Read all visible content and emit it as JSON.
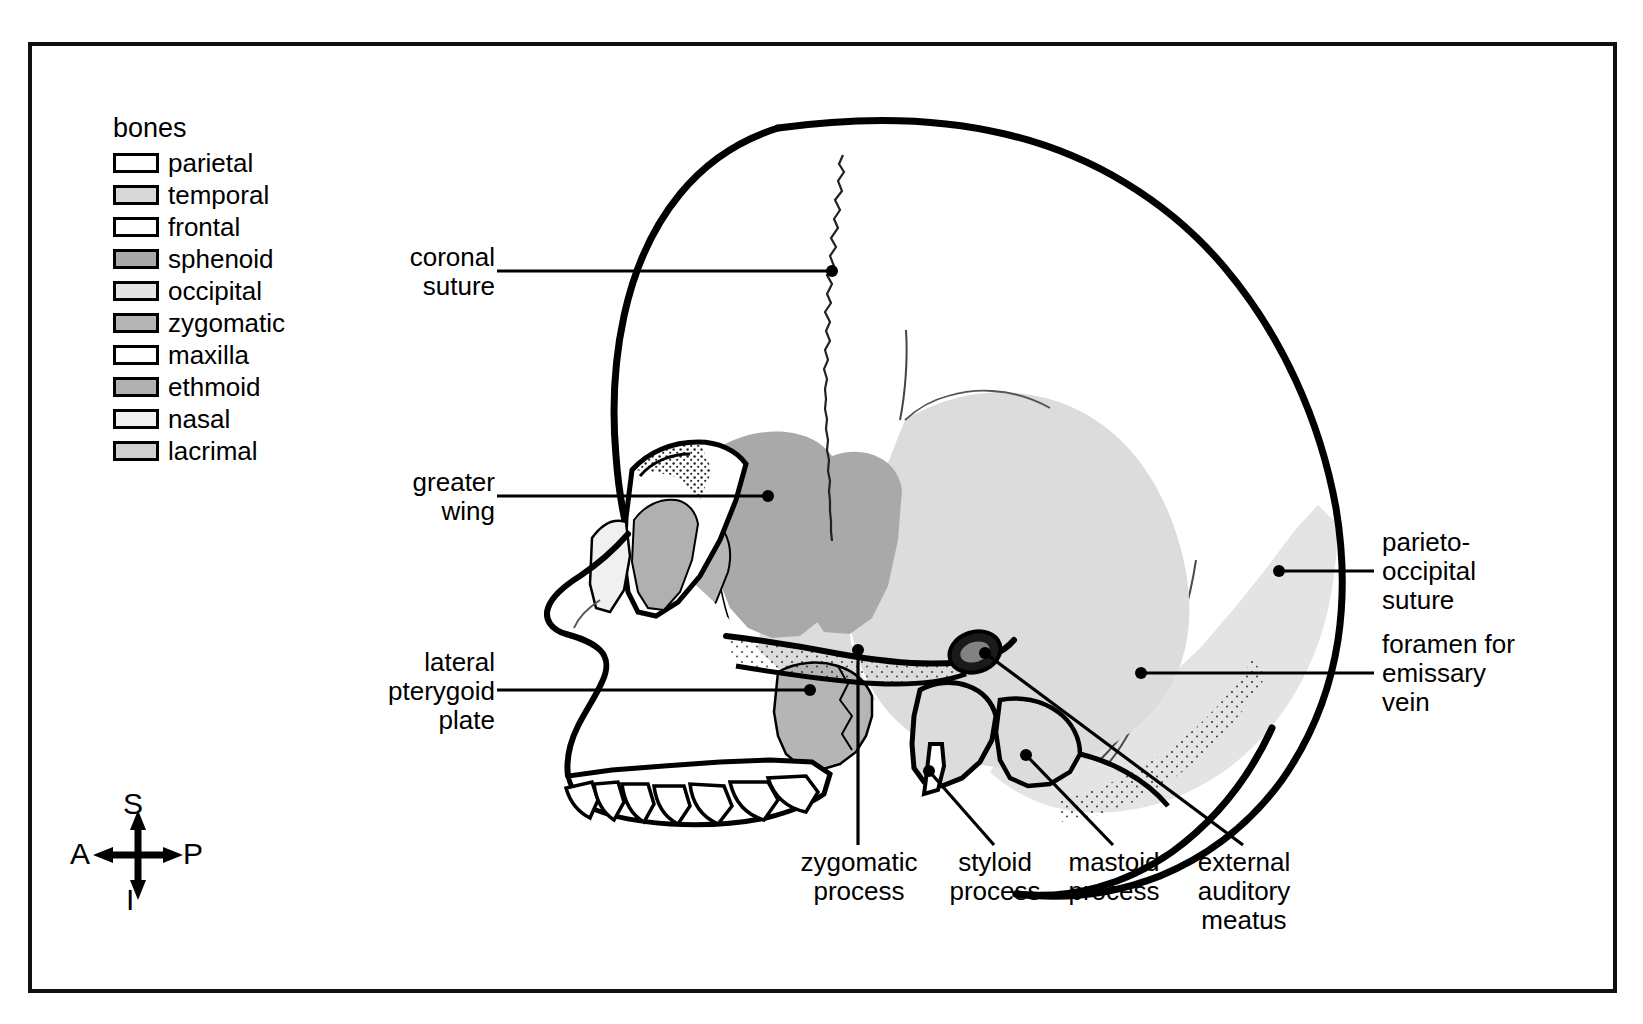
{
  "legend": {
    "title": "bones",
    "items": [
      {
        "label": "parietal",
        "color": "#ffffff"
      },
      {
        "label": "temporal",
        "color": "#d8d8d8"
      },
      {
        "label": "frontal",
        "color": "#ffffff"
      },
      {
        "label": "sphenoid",
        "color": "#a9a9a9"
      },
      {
        "label": "occipital",
        "color": "#e4e4e4"
      },
      {
        "label": "zygomatic",
        "color": "#b5b5b5"
      },
      {
        "label": "maxilla",
        "color": "#ffffff"
      },
      {
        "label": "ethmoid",
        "color": "#b0b0b0"
      },
      {
        "label": "nasal",
        "color": "#f0f0f0"
      },
      {
        "label": "lacrimal",
        "color": "#d0d0d0"
      }
    ]
  },
  "annotations": {
    "coronal_suture": "coronal\nsuture",
    "greater_wing": "greater\nwing",
    "lateral_pterygoid_plate": "lateral\npterygoid\nplate",
    "parieto_occipital_suture": "parieto-\noccipital\nsuture",
    "foramen_emissary_vein": "foramen for\nemissary\nvein",
    "zygomatic_process": "zygomatic\nprocess",
    "styloid_process": "styloid\nprocess",
    "mastoid_process": "mastoid\nprocess",
    "external_auditory_meatus": "external\nauditory\nmeatus"
  },
  "compass": {
    "superior": "S",
    "anterior": "A",
    "posterior": "P",
    "inferior": "I"
  },
  "colors": {
    "ink": "#000000",
    "paper": "#ffffff",
    "temporal_fill": "#dcdcdc",
    "occipital_fill": "#e4e4e4",
    "sphenoid_fill": "#a9a9a9",
    "zygomatic_fill": "#b5b5b5",
    "maxilla_fill": "#ffffff",
    "nasal_fill": "#f0f0f0"
  }
}
